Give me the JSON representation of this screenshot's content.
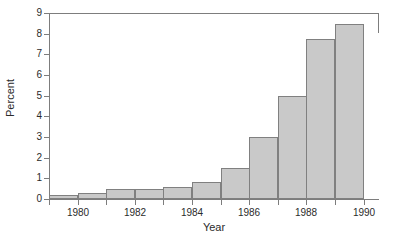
{
  "chart_data": {
    "type": "bar",
    "title": "",
    "subtitle": "",
    "xlabel": "Year",
    "ylabel": "Percent",
    "categories": [
      1979,
      1980,
      1981,
      1982,
      1983,
      1984,
      1985,
      1986,
      1987,
      1988,
      1989
    ],
    "values": [
      0.2,
      0.3,
      0.5,
      0.5,
      0.6,
      0.8,
      1.5,
      3.0,
      5.0,
      7.75,
      8.45
    ],
    "series": [
      {
        "name": "Percent",
        "values": [
          0.2,
          0.3,
          0.5,
          0.5,
          0.6,
          0.8,
          1.5,
          3.0,
          5.0,
          7.75,
          8.45
        ]
      }
    ],
    "xlim": [
      1979,
      1990.5
    ],
    "ylim": [
      0,
      9
    ],
    "y_ticks": [
      0,
      1,
      2,
      3,
      4,
      5,
      6,
      7,
      8,
      9
    ],
    "y_tick_labels": [
      "0",
      "1",
      "2",
      "3",
      "4",
      "5",
      "6",
      "7",
      "8",
      "9"
    ],
    "x_ticks": [
      1979,
      1980,
      1981,
      1982,
      1983,
      1984,
      1985,
      1986,
      1987,
      1988,
      1989,
      1990
    ],
    "x_tick_labels_shown": [
      "1980",
      "1982",
      "1984",
      "1986",
      "1988",
      "1990"
    ],
    "x_tick_label_values": [
      1980,
      1982,
      1984,
      1986,
      1988,
      1990
    ],
    "grid": false,
    "legend": false,
    "legend_position": "none",
    "bar_fill_color": "#c9c9c9",
    "bar_border_color": "#808080",
    "axis_color": "#7d7d7d",
    "text_color": "#2b2b2b",
    "background_color": "#ffffff",
    "annotations": []
  }
}
